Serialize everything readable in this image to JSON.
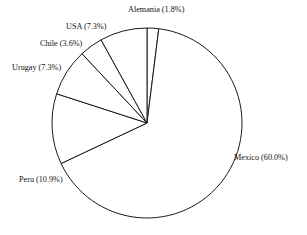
{
  "chart_data": {
    "type": "pie",
    "title": "",
    "subtitle": "",
    "xlabel": "",
    "ylabel": "",
    "legend": "none",
    "grid": false,
    "label_format": "name (percent%)",
    "start_angle_deg": 90,
    "direction": "clockwise",
    "categories": [
      "Alemania",
      "Mexico",
      "Peru",
      "Urugay",
      "Chile",
      "USA"
    ],
    "values": [
      1.8,
      60.0,
      10.9,
      7.3,
      3.6,
      7.3
    ],
    "labels": [
      "Alemania (1.8%)",
      "Mexico (60.0%)",
      "Peru (10.9%)",
      "Urugay (7.3%)",
      "Chile (3.6%)",
      "USA (7.3%)"
    ],
    "slices": [
      {
        "name": "Alemania",
        "percent": 1.8,
        "label": "Alemania (1.8%)",
        "label_x": 128,
        "label_y": 12,
        "anchor": "start"
      },
      {
        "name": "Mexico",
        "percent": 60.0,
        "label": "Mexico (60.0%)",
        "label_x": 234,
        "label_y": 160,
        "anchor": "start"
      },
      {
        "name": "Peru",
        "percent": 10.9,
        "label": "Peru (10.9%)",
        "label_x": 19,
        "label_y": 182,
        "anchor": "start"
      },
      {
        "name": "Urugay",
        "percent": 7.3,
        "label": "Urugay (7.3%)",
        "label_x": 12,
        "label_y": 70,
        "anchor": "start"
      },
      {
        "name": "Chile",
        "percent": 3.6,
        "label": "Chile (3.6%)",
        "label_x": 40,
        "label_y": 46,
        "anchor": "start"
      },
      {
        "name": "USA",
        "percent": 7.3,
        "label": "USA (7.3%)",
        "label_x": 66,
        "label_y": 29,
        "anchor": "start"
      }
    ],
    "geometry": {
      "center_x": 147,
      "center_y": 123,
      "radius": 95
    },
    "colors": {
      "slice_fill": "#ffffff",
      "slice_stroke": "#1a1a1a",
      "label_text": "#111111",
      "background": "#ffffff"
    }
  }
}
